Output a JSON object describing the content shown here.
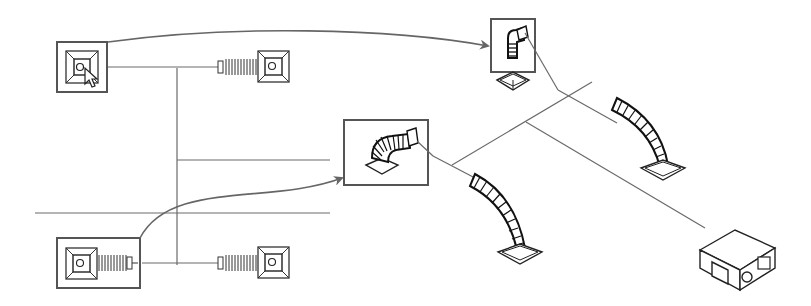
{
  "diagram": {
    "type": "hvac-duct-layout",
    "colors": {
      "line": "#6a6a6a",
      "symbol": "#222222",
      "frame": "#555555",
      "background": "#ffffff"
    },
    "callouts": [
      {
        "id": "top-left-diffuser",
        "kind": "plan-view-ceiling-diffuser",
        "highlighted": true,
        "has-cursor": true,
        "maps-to": "isometric-flex-duct-top"
      },
      {
        "id": "bottom-left-diffuser",
        "kind": "plan-view-diffuser-with-flex",
        "highlighted": true,
        "maps-to": "isometric-flex-duct-middle"
      }
    ],
    "plan_view": {
      "diffusers": [
        "top-left-diffuser",
        "top-right-diffuser",
        "bottom-left-diffuser",
        "bottom-right-diffuser"
      ],
      "walls": 2
    },
    "isometric_view": {
      "components": [
        "flex-duct-top-highlighted",
        "flex-duct-middle-highlighted",
        "flex-duct-right",
        "flex-duct-lower",
        "air-handling-unit"
      ]
    }
  }
}
